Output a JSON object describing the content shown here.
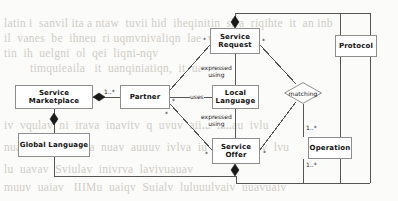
{
  "page": {
    "background_color": "#fbfbf9",
    "line_color": "#555555",
    "node_border_color": "#8e8e8e",
    "text_color": "#111111"
  },
  "background_text": {
    "lines": [
      "latin i  sanvil ita a ntaw  tuvii hid  iheqinitin  slra  riqihte  it  an inb",
      "il  vanes  be  ihneu  ri uqmvnivaliqn  lae  waaea  bei",
      "tin  ih  uelgni  ol  qei  liqni-nqv",
      "timquieaila   it  uanqiniatiqn,  it  uaqa"
    ],
    "lines_lower": [
      "iv  vqulav  ni  irava  inavitv  q  uvuv  aiiia  ianau  ivlu",
      "nuaiiluv  q  ivaqaa  nuav  auuuv  ivlva  iu  aia  uuaqiv  lvu",
      "lu  uavav  Sviulav  inivrva  lavivuauav",
      "muuv  uaiav   IIIMu  uaiqv  Suialv  luluuulvaiv  uuavuaiv"
    ]
  },
  "diagram": {
    "type": "uml-class-diagram",
    "nodes": [
      {
        "id": "service-marketplace",
        "label": "Service Marketplace",
        "shape": "rect",
        "x": 15,
        "y": 85,
        "w": 78,
        "h": 24
      },
      {
        "id": "global-language",
        "label": "Global Language",
        "shape": "rect",
        "x": 18,
        "y": 133,
        "w": 72,
        "h": 24
      },
      {
        "id": "partner",
        "label": "Partner",
        "shape": "rect",
        "x": 120,
        "y": 85,
        "w": 50,
        "h": 24
      },
      {
        "id": "service-request",
        "label": "Service Request",
        "shape": "rect",
        "x": 210,
        "y": 28,
        "w": 50,
        "h": 26
      },
      {
        "id": "local-language",
        "label": "Local Language",
        "shape": "rect",
        "x": 212,
        "y": 85,
        "w": 47,
        "h": 24
      },
      {
        "id": "service-offer",
        "label": "Service Offer",
        "shape": "rect",
        "x": 212,
        "y": 138,
        "w": 48,
        "h": 26
      },
      {
        "id": "matching",
        "label": "matching",
        "shape": "diamond",
        "x": 284,
        "y": 82,
        "w": 38,
        "h": 22
      },
      {
        "id": "protocol",
        "label": "Protocol",
        "shape": "rect",
        "x": 335,
        "y": 35,
        "w": 42,
        "h": 22
      },
      {
        "id": "operation",
        "label": "Operation",
        "shape": "rect",
        "x": 308,
        "y": 137,
        "w": 44,
        "h": 22
      }
    ],
    "edge_labels": [
      {
        "id": "expressed-using-top",
        "text": "expressed\nusing",
        "x": 201,
        "y": 64
      },
      {
        "id": "uses",
        "text": "uses",
        "x": 190,
        "y": 93
      },
      {
        "id": "expressed-using-bottom",
        "text": "expressed\nusing",
        "x": 201,
        "y": 113
      }
    ],
    "multiplicities": [
      {
        "id": "mult-marketplace-partner",
        "text": "1..*",
        "x": 104,
        "y": 88
      },
      {
        "id": "mult-partner-request",
        "text": "*",
        "x": 165,
        "y": 84
      },
      {
        "id": "mult-partner-language",
        "text": "*",
        "x": 172,
        "y": 97
      },
      {
        "id": "mult-partner-offer",
        "text": "*",
        "x": 165,
        "y": 110
      },
      {
        "id": "mult-request-left",
        "text": "*",
        "x": 203,
        "y": 36
      },
      {
        "id": "mult-request-right",
        "text": "*",
        "x": 262,
        "y": 37
      },
      {
        "id": "mult-offer-left",
        "text": "*",
        "x": 205,
        "y": 150
      },
      {
        "id": "mult-offer-right",
        "text": "*",
        "x": 263,
        "y": 149
      },
      {
        "id": "mult-matching-operation",
        "text": "1..*",
        "x": 306,
        "y": 124
      },
      {
        "id": "mult-operation-bottom",
        "text": "1..*",
        "x": 306,
        "y": 161
      }
    ]
  }
}
